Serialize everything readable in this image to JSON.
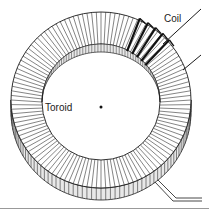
{
  "diagram": {
    "labels": {
      "coil": "Coil",
      "toroid": "Toroid"
    },
    "geometry": {
      "outer": {
        "cx": 101,
        "cy": 100,
        "rx": 90,
        "ry": 88
      },
      "inner": {
        "cx": 101,
        "cy": 102,
        "rx": 59,
        "ry": 58
      },
      "thickness": 12,
      "winding_count": 120,
      "coil_start_deg": 25,
      "coil_end_deg": 48,
      "center_dot": {
        "x": 101,
        "y": 107
      }
    },
    "colors": {
      "line": "#1a1a1a",
      "winding": "#333333",
      "side_fill": "#e8e8e8",
      "face_fill": "#ffffff",
      "baseline": "#999999"
    }
  }
}
